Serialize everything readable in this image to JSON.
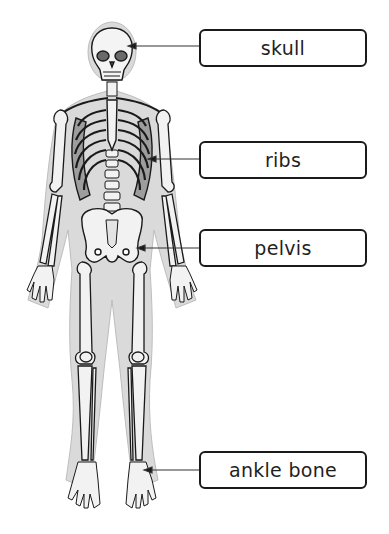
{
  "diagram": {
    "labels": [
      {
        "id": "skull",
        "text": "skull",
        "box_top": 30,
        "arrow_y": 46,
        "arrow_tip_x": 130
      },
      {
        "id": "ribs",
        "text": "ribs",
        "box_top": 141,
        "arrow_y": 159,
        "arrow_tip_x": 150
      },
      {
        "id": "pelvis",
        "text": "pelvis",
        "box_top": 230,
        "arrow_y": 248,
        "arrow_tip_x": 139
      },
      {
        "id": "ankle-bone",
        "text": "ankle bone",
        "box_top": 451,
        "arrow_y": 470,
        "arrow_tip_x": 146
      }
    ]
  },
  "colors": {
    "body_silhouette": "#d9d9d9",
    "bone": "#f2f2f2",
    "outline": "#1a1a1a",
    "box_border": "#1a1a1a",
    "arrow": "#333333"
  }
}
